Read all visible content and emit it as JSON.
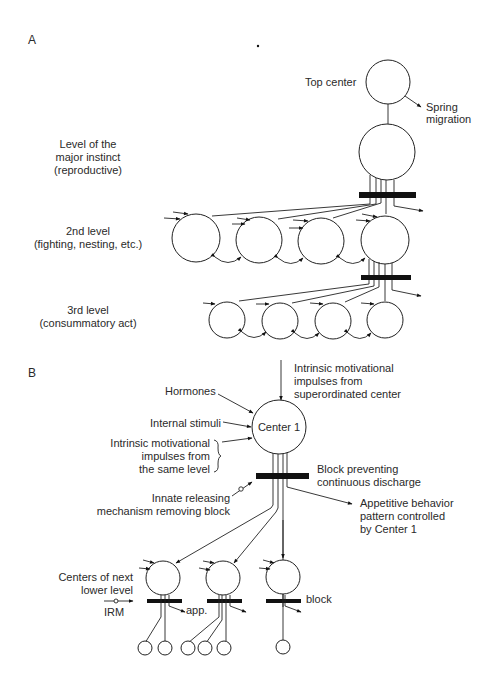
{
  "panel_a": {
    "label": "A",
    "top_center": "Top center",
    "spring": [
      "Spring",
      "migration"
    ],
    "major_level": [
      "Level of the",
      "major instinct",
      "(reproductive)"
    ],
    "second_level": [
      "2nd level",
      "(fighting, nesting, etc.)"
    ],
    "third_level": [
      "3rd level",
      "(consummatory act)"
    ]
  },
  "panel_b": {
    "label": "B",
    "superordinated": [
      "Intrinsic motivational",
      "impulses from",
      "superordinated center"
    ],
    "hormones": "Hormones",
    "internal_stimuli": "Internal stimuli",
    "same_level": [
      "Intrinsic motivational",
      "impulses from",
      "the same level"
    ],
    "center": "Center 1",
    "block": [
      "Block preventing",
      "continuous discharge"
    ],
    "irm": [
      "Innate releasing",
      "mechanism removing block"
    ],
    "appetitive": [
      "Appetitive behavior",
      "pattern controlled",
      "by Center 1"
    ],
    "next_level": [
      "Centers of next",
      "lower level"
    ],
    "irm_short": "IRM",
    "app_short": "app.",
    "block_short": "block"
  }
}
